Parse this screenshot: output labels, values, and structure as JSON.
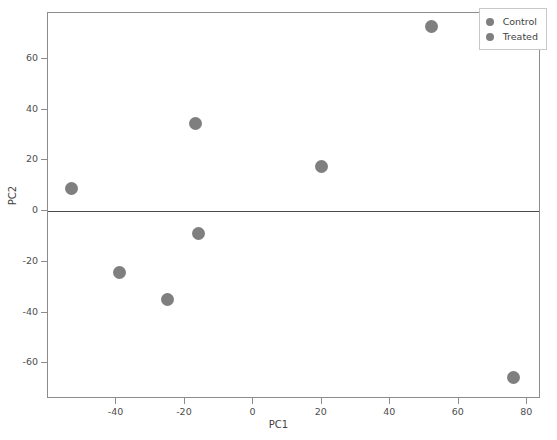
{
  "chart_data": {
    "type": "scatter",
    "title": "",
    "xlabel": "PC1",
    "ylabel": "PC2",
    "xlim": [
      -60,
      84
    ],
    "ylim": [
      -74,
      78
    ],
    "xticks": [
      -40,
      -20,
      0,
      20,
      40,
      60,
      80
    ],
    "yticks": [
      60,
      40,
      20,
      0,
      -20,
      -40,
      -60
    ],
    "xtick_labels": [
      "-40",
      "-20",
      "0",
      "20",
      "40",
      "60",
      "80"
    ],
    "ytick_labels": [
      "60",
      "40",
      "20",
      "0",
      "-20",
      "-40",
      "-60"
    ],
    "grid": false,
    "legend_position": "upper right",
    "reference_lines": [
      {
        "axis": "y",
        "value": 0,
        "color": "#4a4a4a"
      }
    ],
    "marker_color": "#7f7f7f",
    "series": [
      {
        "name": "Control",
        "color": "#7f7f7f",
        "points": [
          {
            "x": -53,
            "y": 9
          },
          {
            "x": -39,
            "y": -24
          },
          {
            "x": -25,
            "y": -35
          },
          {
            "x": -17,
            "y": 34.5
          }
        ]
      },
      {
        "name": "Treated",
        "color": "#7f7f7f",
        "points": [
          {
            "x": -16,
            "y": -9
          },
          {
            "x": 20,
            "y": 17.5
          },
          {
            "x": 52,
            "y": 72.5
          },
          {
            "x": 76,
            "y": -65.5
          }
        ]
      }
    ]
  },
  "legend": {
    "entries": [
      {
        "label": "Control",
        "color": "#7f7f7f"
      },
      {
        "label": "Treated",
        "color": "#7f7f7f"
      }
    ]
  }
}
